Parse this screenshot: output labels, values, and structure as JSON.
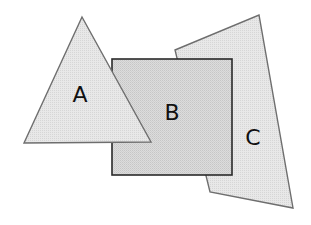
{
  "diagram": {
    "background": "#ffffff",
    "shapes": [
      {
        "id": "C",
        "type": "quadrilateral",
        "label": "C",
        "points": "175,50 259,15 293,208 210,192",
        "fill": "#e6e6e6",
        "stroke": "#6e6e6e",
        "stroke_width": "1.4",
        "label_x": "253",
        "label_y": "137"
      },
      {
        "id": "B",
        "type": "square",
        "label": "B",
        "x": "112",
        "y": "59",
        "width": "120",
        "height": "116",
        "fill": "#d9d9d9",
        "stroke": "#2a2a2a",
        "stroke_width": "1.6",
        "label_x": "172",
        "label_y": "112"
      },
      {
        "id": "A",
        "type": "triangle",
        "label": "A",
        "points": "82,17 151,142 24,143",
        "fill": "#e6e6e6",
        "stroke": "#6e6e6e",
        "stroke_width": "1.4",
        "label_x": "80",
        "label_y": "94"
      }
    ]
  }
}
